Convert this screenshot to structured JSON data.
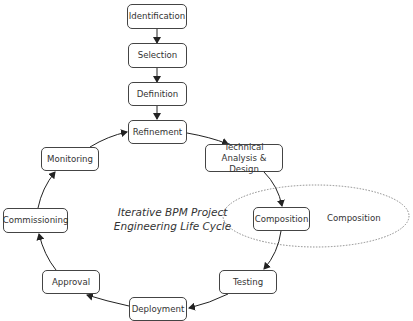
{
  "diagram": {
    "title_line1": "Iterative BPM Project",
    "title_line2": "Engineering Life Cycle",
    "linear_steps": [
      {
        "label": "Identification"
      },
      {
        "label": "Selection"
      },
      {
        "label": "Definition"
      }
    ],
    "cycle_steps": [
      {
        "label": "Refinement"
      },
      {
        "label": "Technical\nAnalysis & Design",
        "line1": "Technical",
        "line2": "Analysis & Design"
      },
      {
        "label": "Composition"
      },
      {
        "label": "Testing"
      },
      {
        "label": "Deployment"
      },
      {
        "label": "Approval"
      },
      {
        "label": "Commissioning"
      },
      {
        "label": "Monitoring"
      }
    ],
    "highlight": {
      "label": "Composition",
      "style": "dotted-ellipse"
    },
    "colors": {
      "stroke": "#333333",
      "text": "#333333",
      "ellipse": "#888888",
      "background": "#ffffff"
    }
  }
}
